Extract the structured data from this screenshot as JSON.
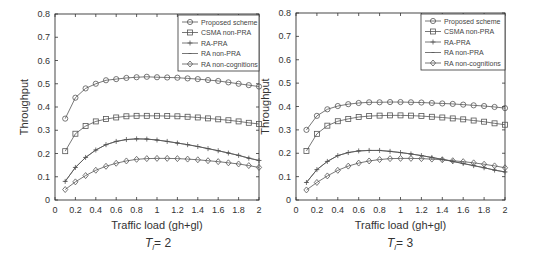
{
  "chart_data": [
    {
      "type": "line",
      "title": "",
      "caption": {
        "symbol": "T",
        "subscript": "l",
        "value": "= 2"
      },
      "xlabel": "Traffic load (gh+gl)",
      "ylabel": "Throughput",
      "xlim": [
        0,
        2
      ],
      "ylim": [
        0,
        0.8
      ],
      "xticks": [
        "0",
        "0.2",
        "0.4",
        "0.6",
        "0.8",
        "1",
        "1.2",
        "1.4",
        "1.6",
        "1.8",
        "2"
      ],
      "yticks": [
        "0",
        "0.1",
        "0.2",
        "0.3",
        "0.4",
        "0.5",
        "0.6",
        "0.7",
        "0.8"
      ],
      "grid": false,
      "legend_position": "upper right",
      "x": [
        0.1,
        0.2,
        0.3,
        0.4,
        0.5,
        0.6,
        0.7,
        0.8,
        0.9,
        1.0,
        1.1,
        1.2,
        1.3,
        1.4,
        1.5,
        1.6,
        1.7,
        1.8,
        1.9,
        2.0
      ],
      "series": [
        {
          "name": "Proposed scheme",
          "marker": "circle",
          "values": [
            0.35,
            0.44,
            0.48,
            0.5,
            0.515,
            0.52,
            0.525,
            0.528,
            0.53,
            0.528,
            0.527,
            0.526,
            0.523,
            0.52,
            0.516,
            0.512,
            0.506,
            0.5,
            0.494,
            0.488
          ]
        },
        {
          "name": "CSMA non-PRA",
          "marker": "square",
          "values": [
            0.21,
            0.285,
            0.318,
            0.338,
            0.348,
            0.355,
            0.36,
            0.362,
            0.362,
            0.362,
            0.361,
            0.36,
            0.358,
            0.355,
            0.351,
            0.347,
            0.343,
            0.338,
            0.332,
            0.327
          ]
        },
        {
          "name": "RA-PRA",
          "marker": "plus",
          "values": [
            0.08,
            0.14,
            0.183,
            0.215,
            0.238,
            0.252,
            0.26,
            0.263,
            0.262,
            0.258,
            0.252,
            0.245,
            0.238,
            0.23,
            0.221,
            0.212,
            0.202,
            0.192,
            0.18,
            0.17
          ]
        },
        {
          "name": "RA non-PRA",
          "marker": "dot",
          "values": [
            0.08,
            0.14,
            0.183,
            0.215,
            0.238,
            0.252,
            0.26,
            0.263,
            0.262,
            0.258,
            0.252,
            0.245,
            0.238,
            0.23,
            0.221,
            0.212,
            0.202,
            0.192,
            0.18,
            0.17
          ]
        },
        {
          "name": "RA non-cognitions",
          "marker": "diamond",
          "values": [
            0.045,
            0.078,
            0.105,
            0.128,
            0.145,
            0.158,
            0.168,
            0.175,
            0.178,
            0.179,
            0.179,
            0.178,
            0.176,
            0.173,
            0.169,
            0.165,
            0.16,
            0.155,
            0.148,
            0.14
          ]
        }
      ]
    },
    {
      "type": "line",
      "title": "",
      "caption": {
        "symbol": "T",
        "subscript": "l",
        "value": "= 3"
      },
      "xlabel": "Traffic load (gh+gl)",
      "ylabel": "Throughput",
      "xlim": [
        0,
        2
      ],
      "ylim": [
        0,
        0.8
      ],
      "xticks": [
        "0",
        "0.2",
        "0.4",
        "0.6",
        "0.8",
        "1",
        "1.2",
        "1.4",
        "1.6",
        "1.8",
        "2"
      ],
      "yticks": [
        "0",
        "0.1",
        "0.2",
        "0.3",
        "0.4",
        "0.5",
        "0.6",
        "0.7",
        "0.8"
      ],
      "grid": false,
      "legend_position": "upper right",
      "x": [
        0.1,
        0.2,
        0.3,
        0.4,
        0.5,
        0.6,
        0.7,
        0.8,
        0.9,
        1.0,
        1.1,
        1.2,
        1.3,
        1.4,
        1.5,
        1.6,
        1.7,
        1.8,
        1.9,
        2.0
      ],
      "series": [
        {
          "name": "Proposed scheme",
          "marker": "circle",
          "values": [
            0.3,
            0.36,
            0.388,
            0.402,
            0.41,
            0.415,
            0.418,
            0.418,
            0.419,
            0.419,
            0.418,
            0.417,
            0.415,
            0.413,
            0.411,
            0.408,
            0.405,
            0.402,
            0.398,
            0.393
          ]
        },
        {
          "name": "CSMA non-PRA",
          "marker": "square",
          "values": [
            0.21,
            0.283,
            0.318,
            0.337,
            0.347,
            0.355,
            0.359,
            0.361,
            0.362,
            0.362,
            0.361,
            0.359,
            0.356,
            0.353,
            0.349,
            0.345,
            0.34,
            0.335,
            0.328,
            0.322
          ]
        },
        {
          "name": "RA-PRA",
          "marker": "plus",
          "values": [
            0.075,
            0.13,
            0.165,
            0.19,
            0.203,
            0.21,
            0.212,
            0.212,
            0.208,
            0.203,
            0.197,
            0.19,
            0.182,
            0.174,
            0.165,
            0.156,
            0.147,
            0.138,
            0.128,
            0.12
          ]
        },
        {
          "name": "RA non-PRA",
          "marker": "dot",
          "values": [
            0.075,
            0.13,
            0.165,
            0.19,
            0.203,
            0.21,
            0.212,
            0.212,
            0.208,
            0.203,
            0.197,
            0.19,
            0.182,
            0.174,
            0.165,
            0.156,
            0.147,
            0.138,
            0.128,
            0.12
          ]
        },
        {
          "name": "RA non-cognitions",
          "marker": "diamond",
          "values": [
            0.043,
            0.075,
            0.103,
            0.127,
            0.145,
            0.158,
            0.167,
            0.173,
            0.177,
            0.178,
            0.178,
            0.177,
            0.175,
            0.172,
            0.168,
            0.164,
            0.159,
            0.153,
            0.146,
            0.138
          ]
        }
      ]
    }
  ],
  "layout": {
    "plots": [
      {
        "x0": 55,
        "x1": 259,
        "y0": 200,
        "y1": 14,
        "legend": {
          "x": 178,
          "y": 15,
          "w": 81,
          "h": 56
        },
        "xlabel_y": 229,
        "caption_x": 158,
        "caption_y": 247
      },
      {
        "x0": 296,
        "x1": 505,
        "y0": 200,
        "y1": 13,
        "legend": {
          "x": 421,
          "y": 14,
          "w": 84,
          "h": 56
        },
        "xlabel_y": 229,
        "caption_x": 400,
        "caption_y": 247
      }
    ],
    "line_color": "#555555",
    "axis_color": "#333333"
  }
}
